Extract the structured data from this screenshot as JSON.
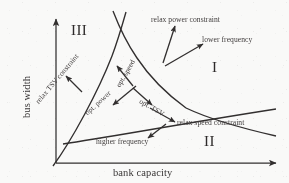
{
  "figure": {
    "axes": {
      "x_label": "bank capacity",
      "y_label": "bus width"
    },
    "regions": [
      {
        "name": "region-one",
        "label": "I"
      },
      {
        "name": "region-two",
        "label": "II"
      },
      {
        "name": "region-three",
        "label": "III"
      }
    ],
    "annotations": [
      {
        "name": "relax-power-constraint",
        "label": "relax power constraint"
      },
      {
        "name": "lower-frequency",
        "label": "lower frequency"
      },
      {
        "name": "relax-speed-constraint",
        "label": "relax speed constraint"
      },
      {
        "name": "higher-frequency",
        "label": "higher frequency"
      },
      {
        "name": "relax-tsv-constraint",
        "label": "relax TSV constraint"
      },
      {
        "name": "opt-power",
        "label": "opt. power"
      },
      {
        "name": "opt-speed",
        "label": "opt. speed"
      },
      {
        "name": "opt-tsv",
        "label": "opt. TSV"
      }
    ],
    "colors": {
      "ink": "#2a2a2a",
      "background": "#fdfdfc"
    }
  }
}
